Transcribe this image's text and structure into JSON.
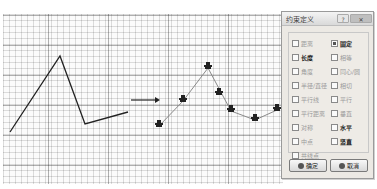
{
  "canvas": {
    "original_polyline": [
      [
        7,
        118
      ],
      [
        57,
        42
      ],
      [
        82,
        110
      ],
      [
        125,
        98
      ]
    ],
    "arrow": {
      "from": [
        128,
        86
      ],
      "to": [
        156,
        86
      ]
    },
    "constrained_polyline": [
      [
        156,
        112
      ],
      [
        180,
        87
      ],
      [
        205,
        54
      ],
      [
        228,
        97
      ],
      [
        252,
        106
      ],
      [
        274,
        96
      ]
    ],
    "constraint_markers": [
      {
        "x": 156,
        "y": 112,
        "icon": "fixed-constraint-icon"
      },
      {
        "x": 180,
        "y": 87,
        "icon": "fixed-constraint-icon"
      },
      {
        "x": 205,
        "y": 54,
        "icon": "fixed-constraint-icon"
      },
      {
        "x": 216,
        "y": 80,
        "icon": "fixed-constraint-icon"
      },
      {
        "x": 228,
        "y": 97,
        "icon": "fixed-constraint-icon"
      },
      {
        "x": 252,
        "y": 106,
        "icon": "fixed-constraint-icon"
      },
      {
        "x": 274,
        "y": 96,
        "icon": "fixed-constraint-icon"
      }
    ]
  },
  "dialog": {
    "title": "约束定义",
    "help_label": "?",
    "close_label": "✕",
    "options": [
      {
        "label": "距离",
        "checked": false,
        "emphasis": false
      },
      {
        "label": "固定",
        "checked": true,
        "emphasis": true
      },
      {
        "label": "长度",
        "checked": false,
        "emphasis": true
      },
      {
        "label": "相等",
        "checked": false,
        "emphasis": false
      },
      {
        "label": "角度",
        "checked": false,
        "emphasis": false
      },
      {
        "label": "同心/圆",
        "checked": false,
        "emphasis": false
      },
      {
        "label": "半径/直径",
        "checked": false,
        "emphasis": false
      },
      {
        "label": "相切",
        "checked": false,
        "emphasis": false
      },
      {
        "label": "平行线",
        "checked": false,
        "emphasis": false
      },
      {
        "label": "平行",
        "checked": false,
        "emphasis": false
      },
      {
        "label": "平行距离",
        "checked": false,
        "emphasis": false
      },
      {
        "label": "垂直",
        "checked": false,
        "emphasis": false
      },
      {
        "label": "对称",
        "checked": false,
        "emphasis": false
      },
      {
        "label": "水平",
        "checked": false,
        "emphasis": true
      },
      {
        "label": "中点",
        "checked": false,
        "emphasis": false
      },
      {
        "label": "竖直",
        "checked": false,
        "emphasis": true
      },
      {
        "label": "共线点",
        "checked": false,
        "emphasis": false
      }
    ],
    "ok_label": "确定",
    "cancel_label": "取消"
  }
}
